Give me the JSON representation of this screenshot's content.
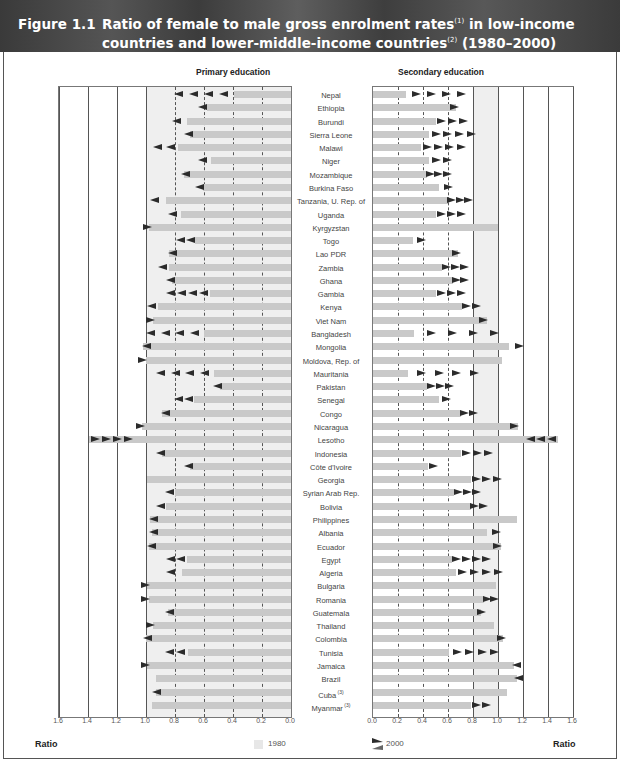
{
  "header": {
    "figure_number": "Figure 1.1",
    "title_line1": "Ratio of female to male gross enrolment rates",
    "title_note1": "(1)",
    "title_line1_end": "in low-income",
    "title_line2": "countries and lower-middle-income countries",
    "title_note2": "(2)",
    "title_line2_end": "(1980–2000)"
  },
  "panels": {
    "primary_title": "Primary education",
    "secondary_title": "Secondary education"
  },
  "axis": {
    "primary_ticks": [
      "1.6",
      "1.4",
      "1.2",
      "1.0",
      "0.8",
      "0.6",
      "0.4",
      "0.2",
      "0.0"
    ],
    "secondary_ticks": [
      "0.0",
      "0.2",
      "0.4",
      "0.6",
      "0.8",
      "1.0",
      "1.2",
      "1.4",
      "1.6"
    ],
    "left_label": "Ratio",
    "right_label": "Ratio"
  },
  "legend": {
    "bar_label": "1980",
    "arrow_label": "2000"
  },
  "colors": {
    "header_bg": "#444444",
    "bar_1980": "#c9c9c9",
    "arrow_2000": "#2b2b2b",
    "parity_shade": "#efefef"
  },
  "chart_data": {
    "type": "bar",
    "xlabel": "Ratio",
    "ylabel": "",
    "xlim": [
      0,
      1.6
    ],
    "grid": true,
    "legend_position": "bottom",
    "categories": [
      "Nepal",
      "Ethiopia",
      "Burundi",
      "Sierra Leone",
      "Malawi",
      "Niger",
      "Mozambique",
      "Burkina Faso",
      "Tanzania, U. Rep. of",
      "Uganda",
      "Kyrgyzstan",
      "Togo",
      "Lao PDR",
      "Zambia",
      "Ghana",
      "Gambia",
      "Kenya",
      "Viet Nam",
      "Bangladesh",
      "Mongolia",
      "Moldova, Rep. of",
      "Mauritania",
      "Pakistan",
      "Senegal",
      "Congo",
      "Nicaragua",
      "Lesotho",
      "Indonesia",
      "Côte d'Ivoire",
      "Georgia",
      "Syrian Arab Rep.",
      "Bolivia",
      "Philippines",
      "Albania",
      "Ecuador",
      "Egypt",
      "Algeria",
      "Bulgaria",
      "Romania",
      "Guatemala",
      "Thailand",
      "Colombia",
      "Tunisia",
      "Jamaica",
      "Brazil",
      "Cuba (3)",
      "Myanmar (3)"
    ],
    "series": [
      {
        "name": "Primary 1980",
        "values": [
          0.39,
          0.58,
          0.72,
          0.7,
          0.78,
          0.55,
          0.74,
          0.61,
          0.86,
          0.76,
          0.98,
          0.66,
          0.84,
          0.84,
          0.82,
          0.56,
          0.92,
          0.95,
          0.6,
          1.02,
          1.0,
          0.53,
          0.49,
          0.67,
          0.89,
          1.03,
          1.39,
          0.89,
          0.7,
          0.99,
          0.8,
          0.86,
          0.97,
          0.96,
          0.98,
          0.72,
          0.75,
          0.99,
          0.98,
          0.85,
          0.95,
          1.0,
          0.71,
          0.99,
          0.93,
          0.93,
          0.96
        ]
      },
      {
        "name": "Primary 2000",
        "values": [
          0.81,
          0.64,
          0.82,
          0.74,
          0.95,
          0.64,
          0.76,
          0.66,
          0.97,
          0.85,
          0.96,
          0.79,
          0.85,
          0.92,
          0.86,
          0.86,
          0.99,
          0.94,
          1.0,
          1.03,
          0.99,
          0.93,
          0.54,
          0.81,
          0.9,
          1.01,
          1.09,
          0.93,
          0.74,
          0.99,
          0.87,
          0.93,
          0.98,
          0.98,
          0.99,
          0.86,
          0.86,
          0.97,
          0.97,
          0.87,
          0.94,
          1.02,
          0.87,
          0.97,
          0.93,
          0.96,
          0.96
        ]
      },
      {
        "name": "Secondary 1980",
        "values": [
          0.26,
          0.66,
          0.5,
          0.45,
          0.38,
          0.45,
          0.43,
          0.53,
          0.6,
          0.5,
          1.0,
          0.32,
          0.68,
          0.55,
          0.64,
          0.5,
          0.71,
          0.91,
          0.33,
          1.09,
          1.03,
          0.28,
          0.43,
          0.53,
          0.7,
          1.16,
          1.48,
          0.7,
          0.44,
          0.78,
          0.65,
          0.78,
          1.15,
          0.91,
          1.02,
          0.63,
          0.66,
          0.98,
          0.89,
          0.86,
          0.97,
          1.04,
          0.61,
          1.13,
          1.15,
          1.07,
          0.78
        ]
      },
      {
        "name": "Secondary 2000",
        "values": [
          0.74,
          0.69,
          0.76,
          0.82,
          0.74,
          0.63,
          0.63,
          0.64,
          0.8,
          0.74,
          1.0,
          0.42,
          0.7,
          0.77,
          0.77,
          0.74,
          0.86,
          0.92,
          1.01,
          1.21,
          1.03,
          0.85,
          0.65,
          0.62,
          0.84,
          1.17,
          1.22,
          0.96,
          0.52,
          1.03,
          0.86,
          0.92,
          1.15,
          1.02,
          1.03,
          0.94,
          1.04,
          0.98,
          1.01,
          0.9,
          0.97,
          1.06,
          1.01,
          1.11,
          1.13,
          1.07,
          0.94
        ]
      }
    ]
  },
  "rows": [
    {
      "name": "Nepal",
      "note": ""
    },
    {
      "name": "Ethiopia",
      "note": ""
    },
    {
      "name": "Burundi",
      "note": ""
    },
    {
      "name": "Sierra Leone",
      "note": ""
    },
    {
      "name": "Malawi",
      "note": ""
    },
    {
      "name": "Niger",
      "note": ""
    },
    {
      "name": "Mozambique",
      "note": ""
    },
    {
      "name": "Burkina Faso",
      "note": ""
    },
    {
      "name": "Tanzania, U. Rep. of",
      "note": ""
    },
    {
      "name": "Uganda",
      "note": ""
    },
    {
      "name": "Kyrgyzstan",
      "note": ""
    },
    {
      "name": "Togo",
      "note": ""
    },
    {
      "name": "Lao PDR",
      "note": ""
    },
    {
      "name": "Zambia",
      "note": ""
    },
    {
      "name": "Ghana",
      "note": ""
    },
    {
      "name": "Gambia",
      "note": ""
    },
    {
      "name": "Kenya",
      "note": ""
    },
    {
      "name": "Viet Nam",
      "note": ""
    },
    {
      "name": "Bangladesh",
      "note": ""
    },
    {
      "name": "Mongolia",
      "note": ""
    },
    {
      "name": "Moldova, Rep. of",
      "note": ""
    },
    {
      "name": "Mauritania",
      "note": ""
    },
    {
      "name": "Pakistan",
      "note": ""
    },
    {
      "name": "Senegal",
      "note": ""
    },
    {
      "name": "Congo",
      "note": ""
    },
    {
      "name": "Nicaragua",
      "note": ""
    },
    {
      "name": "Lesotho",
      "note": ""
    },
    {
      "name": "Indonesia",
      "note": ""
    },
    {
      "name": "Côte d'Ivoire",
      "note": ""
    },
    {
      "name": "Georgia",
      "note": ""
    },
    {
      "name": "Syrian Arab Rep.",
      "note": ""
    },
    {
      "name": "Bolivia",
      "note": ""
    },
    {
      "name": "Philippines",
      "note": ""
    },
    {
      "name": "Albania",
      "note": ""
    },
    {
      "name": "Ecuador",
      "note": ""
    },
    {
      "name": "Egypt",
      "note": ""
    },
    {
      "name": "Algeria",
      "note": ""
    },
    {
      "name": "Bulgaria",
      "note": ""
    },
    {
      "name": "Romania",
      "note": ""
    },
    {
      "name": "Guatemala",
      "note": ""
    },
    {
      "name": "Thailand",
      "note": ""
    },
    {
      "name": "Colombia",
      "note": ""
    },
    {
      "name": "Tunisia",
      "note": ""
    },
    {
      "name": "Jamaica",
      "note": ""
    },
    {
      "name": "Brazil",
      "note": ""
    },
    {
      "name": "Cuba",
      "note": "(3)"
    },
    {
      "name": "Myanmar",
      "note": "(3)"
    }
  ]
}
